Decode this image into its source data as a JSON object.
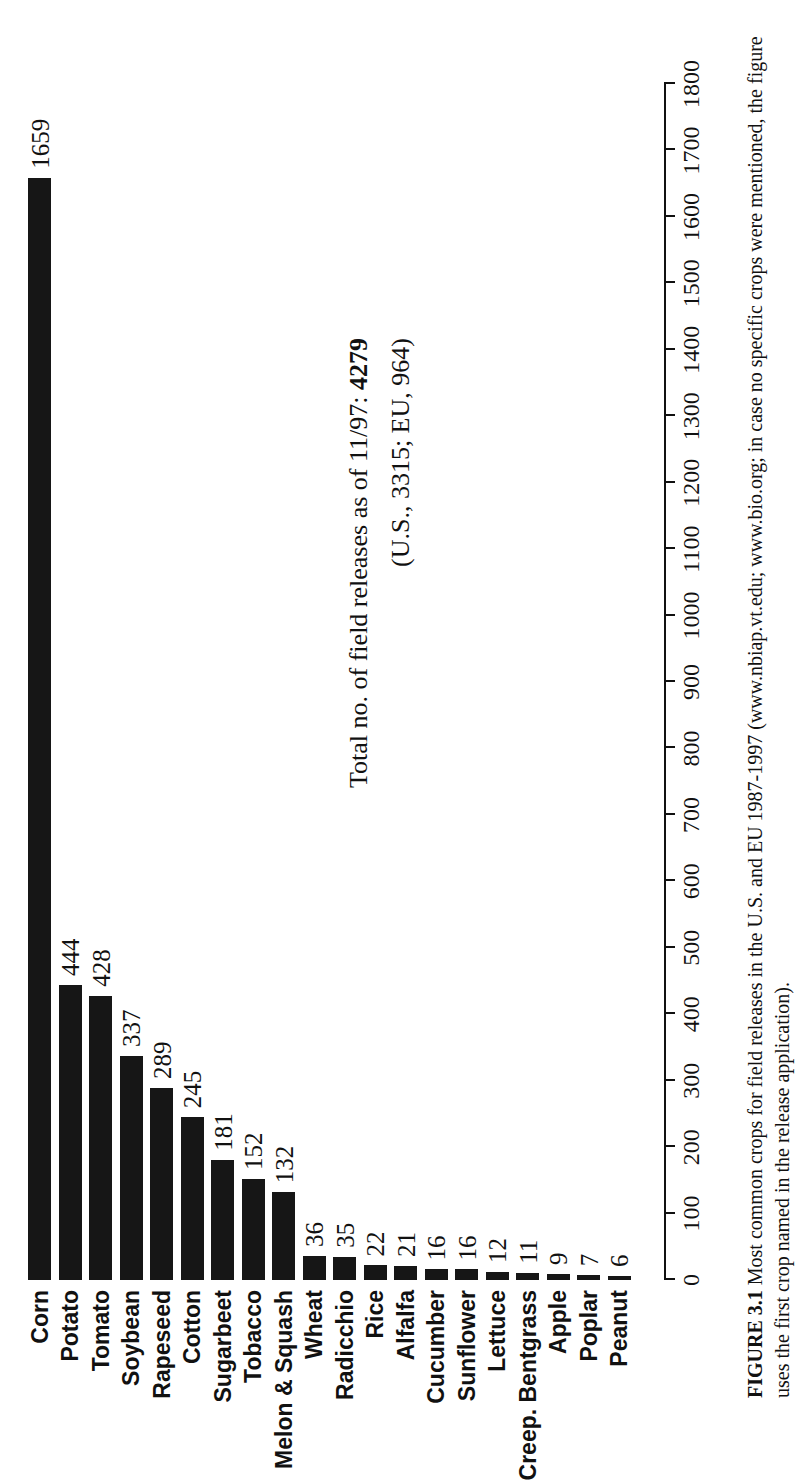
{
  "figure": {
    "caption_number": "FIGURE 3.1",
    "caption_text": "Most common crops for field releases in the U.S. and EU 1987-1997 (www.nbiap.vt.edu; www.bio.org; in case no specific crops were mentioned, the figure uses the first crop named in the release application)."
  },
  "annotation": {
    "line1_prefix": "Total no. of field releases as of 11/97:",
    "line1_value": "4279",
    "line2": "(U.S., 3315; EU, 964)"
  },
  "chart_data": {
    "type": "bar",
    "orientation": "vertical-rotated",
    "title": "",
    "xlabel": "",
    "ylabel": "",
    "ylim": [
      0,
      1800
    ],
    "grid": false,
    "legend": null,
    "tick_labels": [
      "0",
      "100",
      "200",
      "300",
      "400",
      "500",
      "600",
      "700",
      "800",
      "900",
      "1000",
      "1100",
      "1200",
      "1300",
      "1400",
      "1500",
      "1600",
      "1700",
      "1800"
    ],
    "tick_values": [
      0,
      100,
      200,
      300,
      400,
      500,
      600,
      700,
      800,
      900,
      1000,
      1100,
      1200,
      1300,
      1400,
      1500,
      1600,
      1700,
      1800
    ],
    "categories": [
      "Corn",
      "Potato",
      "Tomato",
      "Soybean",
      "Rapeseed",
      "Cotton",
      "Sugarbeet",
      "Tobacco",
      "Melon & Squash",
      "Wheat",
      "Radicchio",
      "Rice",
      "Alfalfa",
      "Cucumber",
      "Sunflower",
      "Lettuce",
      "Creep. Bentgrass",
      "Apple",
      "Poplar",
      "Peanut"
    ],
    "values": [
      1659,
      444,
      428,
      337,
      289,
      245,
      181,
      152,
      132,
      36,
      35,
      22,
      21,
      16,
      16,
      12,
      11,
      9,
      7,
      6
    ],
    "bar_color": "#161616"
  }
}
